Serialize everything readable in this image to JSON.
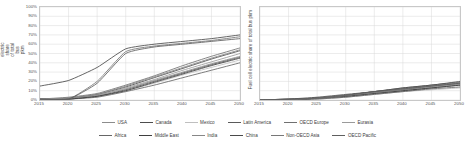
{
  "chart_data": [
    {
      "id": "battery-trolley",
      "type": "line",
      "title": "",
      "xlabel": "",
      "ylabel": "Battery and Trolley electric share of total bus pkm",
      "xlim": [
        2015,
        2050
      ],
      "ylim": [
        0,
        1
      ],
      "grid": true,
      "legend_position": "bottom",
      "xticks": [
        "2015",
        "2020",
        "2025",
        "2030",
        "2035",
        "2040",
        "2045",
        "2050"
      ],
      "yticks": [
        "0%",
        "10%",
        "20%",
        "30%",
        "40%",
        "50%",
        "60%",
        "70%",
        "80%",
        "90%",
        "100%"
      ],
      "x": [
        2015,
        2020,
        2025,
        2030,
        2035,
        2040,
        2045,
        2050
      ],
      "series": [
        {
          "name": "USA",
          "color": "#8c8c8c",
          "values": [
            0.01,
            0.02,
            0.05,
            0.12,
            0.21,
            0.3,
            0.39,
            0.47
          ]
        },
        {
          "name": "Canada",
          "color": "#4d4d4d",
          "values": [
            0.01,
            0.02,
            0.06,
            0.14,
            0.24,
            0.34,
            0.44,
            0.53
          ]
        },
        {
          "name": "Mexico",
          "color": "#bfbfbf",
          "values": [
            0.0,
            0.01,
            0.04,
            0.1,
            0.18,
            0.27,
            0.35,
            0.43
          ]
        },
        {
          "name": "Latin America",
          "color": "#5a5a5a",
          "values": [
            0.0,
            0.01,
            0.04,
            0.11,
            0.2,
            0.29,
            0.38,
            0.46
          ]
        },
        {
          "name": "OECD Europe",
          "color": "#707070",
          "values": [
            0.01,
            0.03,
            0.07,
            0.16,
            0.26,
            0.37,
            0.47,
            0.56
          ]
        },
        {
          "name": "Eurasia",
          "color": "#9a9a9a",
          "values": [
            0.01,
            0.02,
            0.05,
            0.13,
            0.22,
            0.32,
            0.41,
            0.5
          ]
        },
        {
          "name": "Africa",
          "color": "#666666",
          "values": [
            0.0,
            0.01,
            0.03,
            0.09,
            0.16,
            0.24,
            0.32,
            0.4
          ]
        },
        {
          "name": "Middle East",
          "color": "#3f3f3f",
          "values": [
            0.0,
            0.01,
            0.04,
            0.1,
            0.19,
            0.28,
            0.37,
            0.45
          ]
        },
        {
          "name": "India",
          "color": "#878787",
          "values": [
            0.01,
            0.02,
            0.06,
            0.15,
            0.25,
            0.35,
            0.45,
            0.54
          ]
        },
        {
          "name": "China",
          "color": "#4a4a4a",
          "values": [
            0.15,
            0.21,
            0.35,
            0.55,
            0.6,
            0.63,
            0.66,
            0.7
          ]
        },
        {
          "name": "Non-OECD Asia",
          "color": "#777777",
          "values": [
            0.01,
            0.01,
            0.2,
            0.52,
            0.58,
            0.61,
            0.64,
            0.68
          ]
        },
        {
          "name": "OECD Pacific",
          "color": "#5f5f5f",
          "values": [
            0.01,
            0.01,
            0.18,
            0.5,
            0.57,
            0.6,
            0.63,
            0.66
          ]
        }
      ]
    },
    {
      "id": "fuel-cell",
      "type": "line",
      "title": "",
      "xlabel": "",
      "ylabel": "Fuel cell electric share of total bus pkm",
      "xlim": [
        2015,
        2050
      ],
      "ylim": [
        0,
        1
      ],
      "grid": true,
      "legend_position": "bottom",
      "xticks": [
        "2015",
        "2020",
        "2025",
        "2030",
        "2035",
        "2040",
        "2045",
        "2050"
      ],
      "yticks": [],
      "x": [
        2015,
        2020,
        2025,
        2030,
        2035,
        2040,
        2045,
        2050
      ],
      "series": [
        {
          "name": "USA",
          "color": "#8c8c8c",
          "values": [
            0.0,
            0.0,
            0.02,
            0.05,
            0.08,
            0.11,
            0.14,
            0.17
          ]
        },
        {
          "name": "Canada",
          "color": "#4d4d4d",
          "values": [
            0.0,
            0.0,
            0.02,
            0.05,
            0.09,
            0.12,
            0.15,
            0.18
          ]
        },
        {
          "name": "Mexico",
          "color": "#bfbfbf",
          "values": [
            0.0,
            0.0,
            0.01,
            0.03,
            0.06,
            0.09,
            0.11,
            0.13
          ]
        },
        {
          "name": "Latin America",
          "color": "#5a5a5a",
          "values": [
            0.0,
            0.0,
            0.02,
            0.04,
            0.07,
            0.1,
            0.13,
            0.16
          ]
        },
        {
          "name": "OECD Europe",
          "color": "#707070",
          "values": [
            0.0,
            0.01,
            0.02,
            0.05,
            0.09,
            0.13,
            0.16,
            0.19
          ]
        },
        {
          "name": "Eurasia",
          "color": "#9a9a9a",
          "values": [
            0.0,
            0.0,
            0.02,
            0.04,
            0.08,
            0.11,
            0.14,
            0.17
          ]
        },
        {
          "name": "Africa",
          "color": "#666666",
          "values": [
            0.0,
            0.0,
            0.01,
            0.03,
            0.06,
            0.09,
            0.12,
            0.14
          ]
        },
        {
          "name": "Middle East",
          "color": "#3f3f3f",
          "values": [
            0.0,
            0.0,
            0.02,
            0.04,
            0.07,
            0.1,
            0.13,
            0.16
          ]
        },
        {
          "name": "India",
          "color": "#878787",
          "values": [
            0.0,
            0.01,
            0.02,
            0.05,
            0.09,
            0.12,
            0.16,
            0.19
          ]
        },
        {
          "name": "China",
          "color": "#4a4a4a",
          "values": [
            0.0,
            0.01,
            0.03,
            0.06,
            0.09,
            0.13,
            0.16,
            0.2
          ]
        },
        {
          "name": "Non-OECD Asia",
          "color": "#777777",
          "values": [
            0.0,
            0.0,
            0.02,
            0.05,
            0.08,
            0.11,
            0.15,
            0.18
          ]
        },
        {
          "name": "OECD Pacific",
          "color": "#5f5f5f",
          "values": [
            0.0,
            0.01,
            0.02,
            0.05,
            0.09,
            0.12,
            0.15,
            0.18
          ]
        }
      ]
    }
  ],
  "legend": {
    "row1": [
      {
        "label": "USA",
        "color": "#8c8c8c"
      },
      {
        "label": "Canada",
        "color": "#4d4d4d"
      },
      {
        "label": "Mexico",
        "color": "#bfbfbf"
      },
      {
        "label": "Latin America",
        "color": "#5a5a5a"
      },
      {
        "label": "OECD Europe",
        "color": "#707070"
      },
      {
        "label": "Eurasia",
        "color": "#9a9a9a"
      }
    ],
    "row2": [
      {
        "label": "Africa",
        "color": "#666666"
      },
      {
        "label": "Middle East",
        "color": "#3f3f3f"
      },
      {
        "label": "India",
        "color": "#878787"
      },
      {
        "label": "China",
        "color": "#4a4a4a"
      },
      {
        "label": "Non-OECD Asia",
        "color": "#777777"
      },
      {
        "label": "OECD Pacific",
        "color": "#5f5f5f"
      }
    ]
  }
}
